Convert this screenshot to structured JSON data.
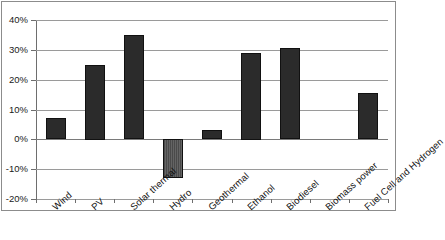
{
  "chart_data": {
    "type": "bar",
    "title": "",
    "subtitle": "",
    "xlabel": "",
    "ylabel": "",
    "categories": [
      "Wind",
      "PV",
      "Solar thermal",
      "Hydro",
      "Geothermal",
      "Ethanol",
      "Biodiesel",
      "Biomass power",
      "Fuel Cell and Hydrogen"
    ],
    "values": [
      7,
      25,
      35,
      -13,
      3,
      29,
      30.5,
      0,
      15.5
    ],
    "ylim": [
      -20,
      40
    ],
    "ytick_values": [
      40,
      30,
      20,
      10,
      0,
      -10,
      -20
    ],
    "ytick_labels": [
      "40%",
      "30%",
      "20%",
      "10%",
      "0%",
      "-10%",
      "-20%"
    ],
    "grid": true,
    "legend": false,
    "legend_position": "none",
    "bar_color": "#2b2b2b",
    "negative_bar_color": "#5a5a5a",
    "gridline_color": "#9a9a9a",
    "frame_color": "#8c8c8c",
    "xtick_label_rotation": -42
  }
}
